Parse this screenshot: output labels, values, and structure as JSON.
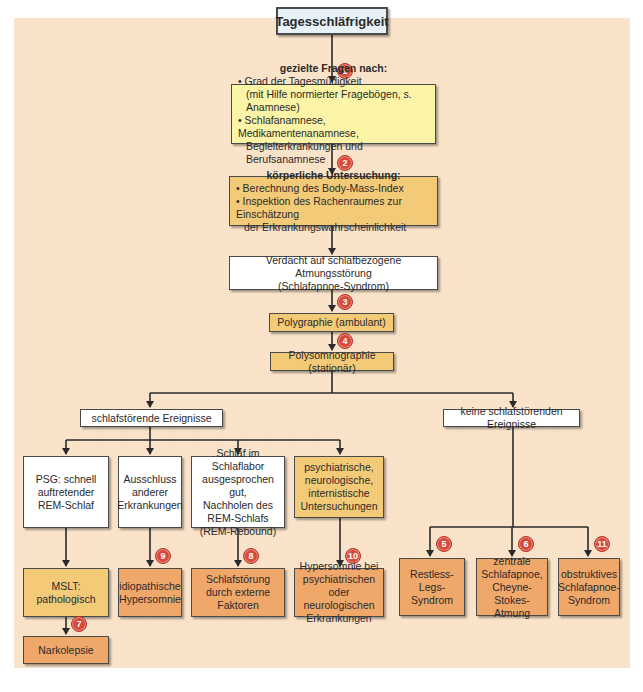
{
  "diagram": {
    "title": "Tagesschläfrigkeit",
    "colors": {
      "background_panel": "#f9e2c8",
      "white_box": "#ffffff",
      "title_box": "#e6f1f8",
      "yellow_box": "#fbf3a6",
      "gold_box": "#f3ca78",
      "orange_box": "#f0a76a",
      "badge": "#d9493a",
      "line": "#2a2a2a"
    },
    "step1": {
      "heading": "gezielte Fragen nach:",
      "bullets": [
        "• Grad der Tagesmüdigkeit",
        "(mit Hilfe normierter Fragebögen, s. Anamnese)",
        "• Schlafanamnese, Medikamentenanamnese,",
        "Begleiterkrankungen und Berufsanamnese"
      ]
    },
    "step2": {
      "heading": "körperliche Untersuchung:",
      "bullets": [
        "• Berechnung des Body-Mass-Index",
        "• Inspektion des Rachenraumes zur Einschätzung",
        "der Erkrankungswahrscheinlichkeit"
      ]
    },
    "suspicion": {
      "line1": "Verdacht auf schlafbezogene Atmungsstörung",
      "line2": "(Schlafapnoe-Syndrom)"
    },
    "polygraphie": "Polygraphie (ambulant)",
    "polysomnographie": "Polysomnographie (stationär)",
    "branch_left": "schlafstörende Ereignisse",
    "branch_right": "keine schlafstörenden Ereignisse",
    "left_findings": [
      {
        "lines": [
          "PSG: schnell",
          "auftretender",
          "REM-Schlaf"
        ]
      },
      {
        "lines": [
          "Ausschluss",
          "anderer",
          "Erkrankungen"
        ]
      },
      {
        "lines": [
          "Schlaf im Schlaflabor",
          "ausgesprochen gut,",
          "Nachholen des",
          "REM-Schlafs",
          "(REM-Rebound)"
        ]
      },
      {
        "lines": [
          "psychiatrische,",
          "neurologische,",
          "internistische",
          "Untersuchungen"
        ]
      }
    ],
    "mslt": "MSLT: pathologisch",
    "narkolepsie": "Narkolepsie",
    "left_diagnoses": [
      {
        "badge": "9",
        "lines": [
          "idiopathische",
          "Hypersomnie"
        ]
      },
      {
        "badge": "8",
        "lines": [
          "Schlafstörung",
          "durch externe",
          "Faktoren"
        ]
      },
      {
        "badge": "10",
        "lines": [
          "Hypersomnie bei",
          "psychiatrischen oder",
          "neurologischen",
          "Erkrankungen"
        ]
      }
    ],
    "right_diagnoses": [
      {
        "badge": "5",
        "lines": [
          "Restless-",
          "Legs-",
          "Syndrom"
        ]
      },
      {
        "badge": "6",
        "lines": [
          "zentrale",
          "Schlafapnoe,",
          "Cheyne-",
          "Stokes-Atmung"
        ]
      },
      {
        "badge": "11",
        "lines": [
          "obstruktives",
          "Schlafapnoe-",
          "Syndrom"
        ]
      }
    ],
    "badges": {
      "b1": "1",
      "b2": "2",
      "b3": "3",
      "b4": "4",
      "b7": "7"
    }
  }
}
